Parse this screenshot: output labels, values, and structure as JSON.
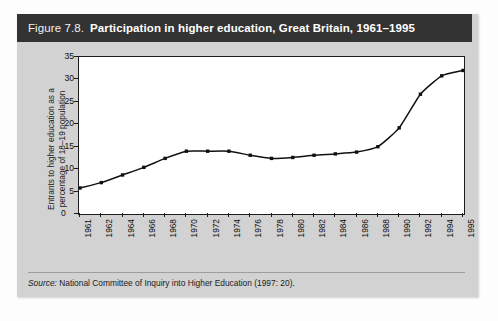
{
  "figure": {
    "number": "Figure 7.8.",
    "caption": "Participation in higher education, Great Britain, 1961–1995",
    "source_label": "Source:",
    "source_text": "National Committee of Inquiry into Higher Education (1997: 20)."
  },
  "chart_data": {
    "type": "line",
    "title": "Participation in higher education, Great Britain, 1961–1995",
    "xlabel": "",
    "ylabel": "Entrants to higher education as a percentage of 18–19 population",
    "ylabel_lines": [
      "Entrants to higher education as a",
      "percentage of 18–19 population"
    ],
    "categories": [
      "1961",
      "1962",
      "1964",
      "1966",
      "1968",
      "1970",
      "1972",
      "1974",
      "1976",
      "1978",
      "1980",
      "1982",
      "1984",
      "1986",
      "1988",
      "1990",
      "1992",
      "1994",
      "1995"
    ],
    "values": [
      5.8,
      7.0,
      8.7,
      10.4,
      12.4,
      14.0,
      14.0,
      14.0,
      13.1,
      12.4,
      12.6,
      13.1,
      13.4,
      13.8,
      15.0,
      19.2,
      26.7,
      30.8,
      32.0
    ],
    "ylim": [
      0,
      35
    ],
    "yticks": [
      0,
      5,
      10,
      15,
      20,
      25,
      30,
      35
    ],
    "ytick_labels": [
      "0",
      "5",
      "10",
      "15",
      "20",
      "25",
      "30",
      "35"
    ],
    "xtick_labels": [
      "1961",
      "1962",
      "1964",
      "1966",
      "1968",
      "1970",
      "1972",
      "1974",
      "1976",
      "1978",
      "1980",
      "1982",
      "1984",
      "1986",
      "1988",
      "1990",
      "1992",
      "1994",
      "1995"
    ],
    "grid": false,
    "legend": false,
    "marker": "square",
    "line_color": "#111111",
    "marker_color": "#111111",
    "plot_bg": "#ffffff"
  },
  "colors": {
    "title_bar_bg": "#333333",
    "title_text": "#ffffff",
    "panel_bg": "#d2d2d2",
    "axis": "#1c1c1c",
    "rule": "#9d9d9d"
  }
}
